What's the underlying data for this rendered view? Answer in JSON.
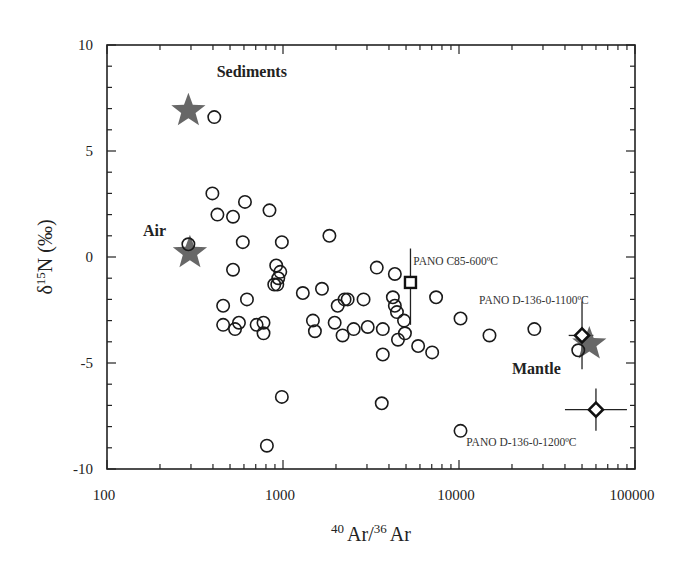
{
  "chart_data": {
    "type": "scatter",
    "title": "",
    "xlabel": "40Ar/36Ar",
    "xlabel_parts": {
      "sup1": "40",
      "base1": "Ar/",
      "sup2": "36",
      "base2": "Ar"
    },
    "ylabel": "δ15N (‰)",
    "ylabel_parts": {
      "pre": "δ",
      "sup": "15",
      "post": "N (‰)"
    },
    "xscale": "log",
    "xlim": [
      100,
      100000
    ],
    "ylim": [
      -10,
      10
    ],
    "x_ticks": [
      100,
      1000,
      10000,
      100000
    ],
    "x_tick_labels": [
      "100",
      "1000",
      "10000",
      "100000"
    ],
    "y_ticks": [
      -10,
      -5,
      0,
      5,
      10
    ],
    "y_tick_labels": [
      "-10",
      "-5",
      "0",
      "5",
      "10"
    ],
    "grid": false,
    "legend": null,
    "series": [
      {
        "name": "Samples",
        "marker": "open-circle",
        "points": [
          [
            407,
            6.6
          ],
          [
            397,
            3.0
          ],
          [
            424,
            2.0
          ],
          [
            520,
            1.9
          ],
          [
            608,
            2.6
          ],
          [
            838,
            2.2
          ],
          [
            290,
            0.6
          ],
          [
            591,
            0.7
          ],
          [
            985,
            0.7
          ],
          [
            1835,
            1.0
          ],
          [
            520,
            -0.6
          ],
          [
            624,
            -2.0
          ],
          [
            457,
            -2.3
          ],
          [
            457,
            -3.2
          ],
          [
            534,
            -3.4
          ],
          [
            562,
            -3.1
          ],
          [
            708,
            -3.2
          ],
          [
            775,
            -3.1
          ],
          [
            775,
            -3.6
          ],
          [
            915,
            -0.4
          ],
          [
            940,
            -1.0
          ],
          [
            892,
            -1.3
          ],
          [
            928,
            -1.3
          ],
          [
            965,
            -0.7
          ],
          [
            985,
            -6.6
          ],
          [
            810,
            -8.9
          ],
          [
            1296,
            -1.7
          ],
          [
            1665,
            -1.5
          ],
          [
            1479,
            -3.0
          ],
          [
            1518,
            -3.5
          ],
          [
            1966,
            -3.1
          ],
          [
            2045,
            -2.3
          ],
          [
            2238,
            -2.0
          ],
          [
            2180,
            -3.7
          ],
          [
            2330,
            -2.0
          ],
          [
            2869,
            -2.0
          ],
          [
            2521,
            -3.4
          ],
          [
            3030,
            -3.3
          ],
          [
            3410,
            -0.5
          ],
          [
            3690,
            -3.4
          ],
          [
            4320,
            -0.8
          ],
          [
            4210,
            -1.9
          ],
          [
            4320,
            -2.3
          ],
          [
            4440,
            -2.6
          ],
          [
            4870,
            -3.0
          ],
          [
            4930,
            -3.6
          ],
          [
            4500,
            -3.9
          ],
          [
            5860,
            -4.2
          ],
          [
            7040,
            -4.5
          ],
          [
            3690,
            -4.6
          ],
          [
            3640,
            -6.9
          ],
          [
            7410,
            -1.9
          ],
          [
            10200,
            -2.9
          ],
          [
            10200,
            -8.2
          ],
          [
            14900,
            -3.7
          ],
          [
            26800,
            -3.4
          ],
          [
            47600,
            -4.4
          ]
        ]
      },
      {
        "name": "Reservoirs",
        "marker": "filled-star",
        "color": "#5a5a5a",
        "points": [
          {
            "label": "Sediments",
            "x": 290,
            "y": 6.9
          },
          {
            "label": "Air",
            "x": 296,
            "y": 0.2
          },
          {
            "label": "Mantle",
            "x": 55000,
            "y": -4.1
          }
        ]
      },
      {
        "name": "PANO C85-600°C",
        "marker": "open-square",
        "points": [
          {
            "x": 5300,
            "y": -1.2,
            "y_err": [
              1.6,
              2.0
            ],
            "x_err": null
          }
        ]
      },
      {
        "name": "PANO D-136-0-1100°C",
        "marker": "open-diamond",
        "points": [
          {
            "x": 50000,
            "y": -3.7,
            "y_err": [
              1.6,
              1.6
            ],
            "x_err": [
              8000,
              8000
            ]
          }
        ]
      },
      {
        "name": "PANO D-136-0-1200°C",
        "marker": "open-diamond",
        "points": [
          {
            "x": 60000,
            "y": -7.2,
            "y_err": [
              1.0,
              1.0
            ],
            "x_err": [
              20000,
              30000
            ]
          }
        ]
      }
    ],
    "annotations": [
      {
        "text": "Sediments",
        "x": 420,
        "y": 8.5,
        "bold": true
      },
      {
        "text": "Air",
        "x": 160,
        "y": 1.0,
        "bold": true
      },
      {
        "text": "Mantle",
        "x": 20000,
        "y": -5.5,
        "bold": true
      },
      {
        "text": "PANO C85-600ºC",
        "x": 5500,
        "y": -0.4
      },
      {
        "text": "PANO D-136-0-1100ºC",
        "x": 13000,
        "y": -2.2
      },
      {
        "text": "PANO D-136-0-1200ºC",
        "x": 11000,
        "y": -8.9
      }
    ]
  }
}
